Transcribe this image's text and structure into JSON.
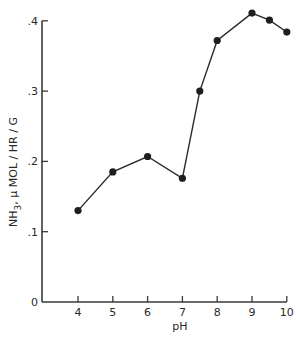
{
  "chart_data": {
    "type": "line",
    "title": "",
    "xlabel": "pH",
    "ylabel": "NH3, μ MOL / HR / G",
    "x_ticks": [
      4,
      5,
      6,
      7,
      8,
      9,
      10
    ],
    "x_tick_labels": [
      "4",
      "5",
      "6",
      "7",
      "8",
      "9",
      "10"
    ],
    "y_ticks": [
      0,
      0.1,
      0.2,
      0.3,
      0.4
    ],
    "y_tick_labels": [
      "0",
      ".1",
      ".2",
      ".3",
      ".4"
    ],
    "xlim": [
      3,
      10
    ],
    "ylim": [
      0,
      0.41
    ],
    "grid": false,
    "legend": null,
    "series": [
      {
        "name": "NH3 production",
        "marker": "filled-circle",
        "color": "#1e1e1e",
        "x": [
          4,
          5,
          6,
          7,
          7.5,
          8,
          9,
          9.5,
          10
        ],
        "y": [
          0.13,
          0.185,
          0.207,
          0.176,
          0.3,
          0.372,
          0.411,
          0.401,
          0.384
        ]
      }
    ]
  }
}
